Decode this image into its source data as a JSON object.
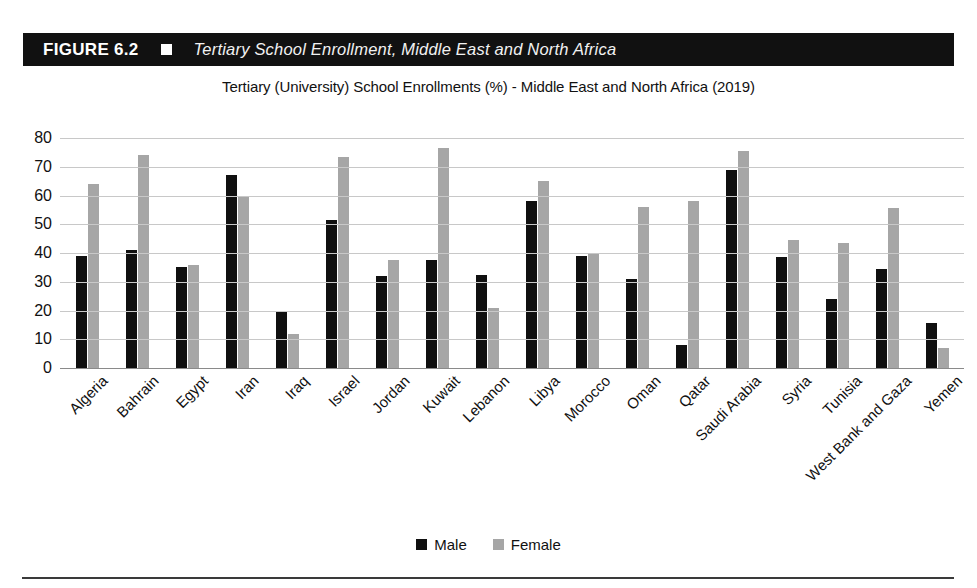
{
  "figure": {
    "number_label": "FIGURE 6.2",
    "marker_icon": "square-marker-icon",
    "title": "Tertiary School Enrollment, Middle East and North Africa"
  },
  "chart_data": {
    "type": "bar",
    "title": "Tertiary (University) School Enrollments (%) - Middle East and North Africa (2019)",
    "xlabel": "",
    "ylabel": "",
    "ylim": [
      0,
      80
    ],
    "yticks": [
      0,
      10,
      20,
      30,
      40,
      50,
      60,
      70,
      80
    ],
    "grid": true,
    "legend_position": "bottom",
    "categories": [
      "Algeria",
      "Bahrain",
      "Egypt",
      "Iran",
      "Iraq",
      "Israel",
      "Jordan",
      "Kuwait",
      "Lebanon",
      "Libya",
      "Morocco",
      "Oman",
      "Qatar",
      "Saudi Arabia",
      "Syria",
      "Tunisia",
      "West Bank and Gaza",
      "Yemen"
    ],
    "series": [
      {
        "name": "Male",
        "color": "#101010",
        "values": [
          39,
          41,
          35,
          67,
          20,
          51.5,
          32,
          37.5,
          32.5,
          58,
          39,
          31,
          8,
          69,
          38.5,
          24,
          34.5,
          15.5
        ]
      },
      {
        "name": "Female",
        "color": "#a6a6a6",
        "values": [
          64,
          74,
          36,
          59.5,
          12,
          73.5,
          37.5,
          76.5,
          21,
          65,
          40,
          56,
          58,
          75.5,
          44.5,
          43.5,
          55.5,
          7
        ]
      }
    ]
  },
  "colors": {
    "male": "#101010",
    "female": "#a6a6a6",
    "header_bar": "#111111",
    "gridline": "#c8c8c8",
    "axis": "#8a8a8a"
  }
}
